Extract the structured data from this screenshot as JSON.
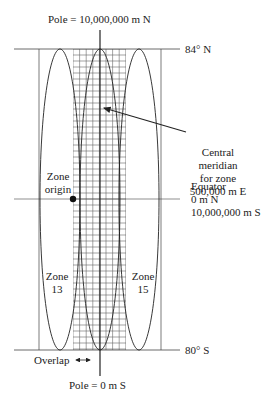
{
  "title_top": "Pole = 10,000,000 m N",
  "title_bottom": "Pole = 0 m S",
  "lat_north": "84° N",
  "lat_south": "80° S",
  "central_meridian": {
    "line1": "Central",
    "line2": "meridian",
    "line3": "for zone",
    "line4": "500,000 m E"
  },
  "equator": {
    "line1": "Equator",
    "line2": "0 m N",
    "line3": "10,000,000 m S"
  },
  "zone_origin": {
    "line1": "Zone",
    "line2": "origin"
  },
  "zone_left": {
    "line1": "Zone",
    "line2": "13"
  },
  "zone_right": {
    "line1": "Zone",
    "line2": "15"
  },
  "overlap": "Overlap",
  "colors": {
    "line": "#333333",
    "grid": "#555555",
    "background": "#ffffff"
  }
}
